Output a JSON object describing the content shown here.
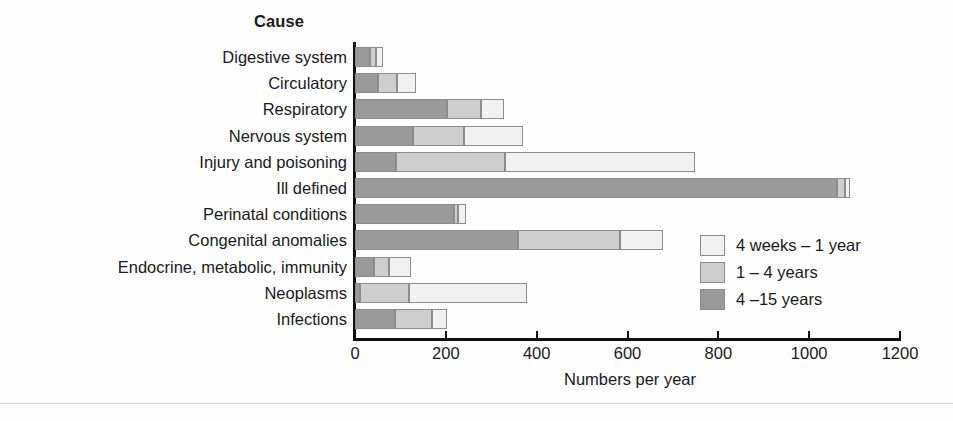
{
  "chart_data": {
    "type": "bar",
    "orientation": "horizontal",
    "stacked": true,
    "title": "",
    "category_header": "Cause",
    "xlabel": "Numbers per year",
    "ylabel": "",
    "xlim": [
      0,
      1200
    ],
    "xticks": [
      0,
      200,
      400,
      600,
      800,
      1000,
      1200
    ],
    "xtick_labels": [
      "0",
      "200",
      "400",
      "600",
      "800",
      "1000",
      "1200"
    ],
    "grid": false,
    "legend_position": "inside-right",
    "categories": [
      "Digestive system",
      "Circulatory",
      "Respiratory",
      "Nervous system",
      "Injury and poisoning",
      "Ill defined",
      "Perinatal conditions",
      "Congenital anomalies",
      "Endocrine, metabolic, immunity",
      "Neoplasms",
      "Infections"
    ],
    "series": [
      {
        "name": "4 –15 years",
        "color": "#9a9a9a",
        "values": [
          33,
          51,
          203,
          128,
          90,
          1061,
          218,
          359,
          42,
          11,
          88
        ]
      },
      {
        "name": "1 – 4 years",
        "color": "#cecece",
        "values": [
          13,
          42,
          75,
          112,
          240,
          18,
          9,
          225,
          33,
          108,
          82
        ]
      },
      {
        "name": "4 weeks – 1 year",
        "color": "#f1f1f1",
        "values": [
          16,
          41,
          50,
          130,
          419,
          11,
          18,
          94,
          48,
          260,
          33
        ]
      }
    ],
    "totals": [
      62,
      134,
      328,
      370,
      749,
      1090,
      245,
      678,
      123,
      379,
      203
    ]
  },
  "legend": {
    "entries": [
      {
        "label": "4 weeks – 1 year",
        "swatch": "s1"
      },
      {
        "label": "1 – 4 years",
        "swatch": "s2"
      },
      {
        "label": "4 –15 years",
        "swatch": "s3"
      }
    ]
  }
}
